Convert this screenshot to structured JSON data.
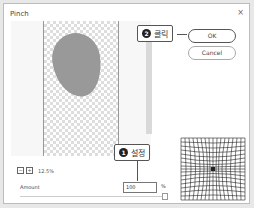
{
  "dialog": {
    "title": "Pinch",
    "close_glyph": "×"
  },
  "buttons": {
    "ok": "OK",
    "cancel": "Cancel"
  },
  "callouts": [
    {
      "number": "2",
      "label": "클릭"
    },
    {
      "number": "1",
      "label": "설정"
    }
  ],
  "zoom": {
    "minus": "−",
    "plus": "+",
    "level": "12.5%"
  },
  "amount": {
    "label": "Amount",
    "value": "100",
    "unit": "%"
  }
}
